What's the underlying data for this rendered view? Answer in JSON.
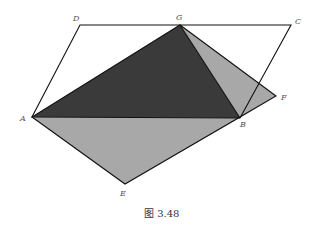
{
  "figure": {
    "caption": "图 3.48",
    "points": {
      "A": {
        "label": "A",
        "x": 32,
        "y": 117
      },
      "B": {
        "label": "B",
        "x": 240,
        "y": 118
      },
      "C": {
        "label": "C",
        "x": 291,
        "y": 25
      },
      "D": {
        "label": "D",
        "x": 80,
        "y": 25
      },
      "E": {
        "label": "E",
        "x": 125,
        "y": 184
      },
      "F": {
        "label": "F",
        "x": 276,
        "y": 96
      },
      "G": {
        "label": "G",
        "x": 180,
        "y": 25
      }
    },
    "colors": {
      "dark_fill": "#3a3a3a",
      "light_fill": "#a8a8a8",
      "stroke": "#111111"
    }
  }
}
